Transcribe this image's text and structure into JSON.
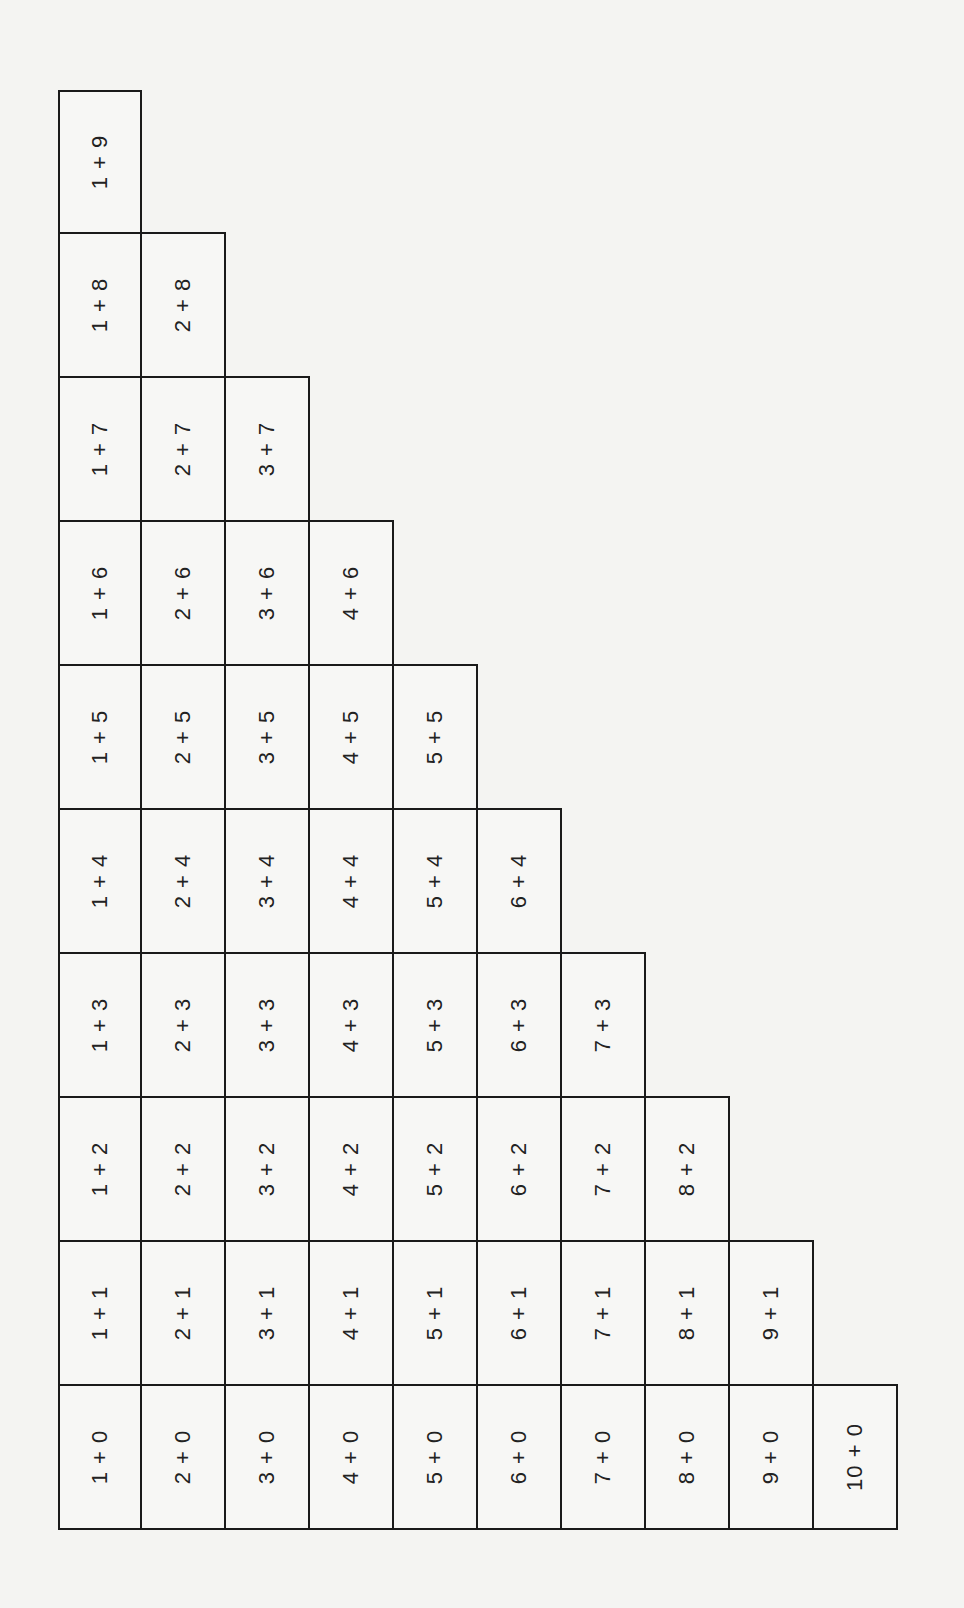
{
  "document": {
    "title": "Addition facts staircase table (rotated)",
    "rotation_deg": -90,
    "border_color": "#1a1a1a",
    "background": "#f4f4f2"
  },
  "grid": {
    "columns": [
      [
        "1 + 9",
        "1 + 8",
        "1 + 7",
        "1 + 6",
        "1 + 5",
        "1 + 4",
        "1 + 3",
        "1 + 2",
        "1 + 1",
        "1 + 0"
      ],
      [
        "2 + 8",
        "2 + 7",
        "2 + 6",
        "2 + 5",
        "2 + 4",
        "2 + 3",
        "2 + 2",
        "2 + 1",
        "2 + 0"
      ],
      [
        "3 + 7",
        "3 + 6",
        "3 + 5",
        "3 + 4",
        "3 + 3",
        "3 + 2",
        "3 + 1",
        "3 + 0"
      ],
      [
        "4 + 6",
        "4 + 5",
        "4 + 4",
        "4 + 3",
        "4 + 2",
        "4 + 1",
        "4 + 0"
      ],
      [
        "5 + 5",
        "5 + 4",
        "5 + 3",
        "5 + 2",
        "5 + 1",
        "5 + 0"
      ],
      [
        "6 + 4",
        "6 + 3",
        "6 + 2",
        "6 + 1",
        "6 + 0"
      ],
      [
        "7 + 3",
        "7 + 2",
        "7 + 1",
        "7 + 0"
      ],
      [
        "8 + 2",
        "8 + 1",
        "8 + 0"
      ],
      [
        "9 + 1",
        "9 + 0"
      ],
      [
        "10 + 0"
      ]
    ]
  }
}
